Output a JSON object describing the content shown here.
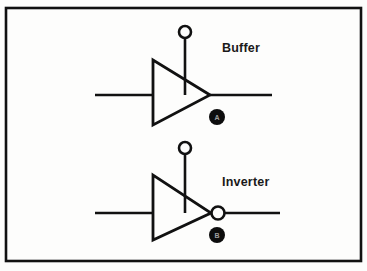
{
  "figure": {
    "background_color": "#fdfdfc",
    "ink_color": "#111111",
    "border": {
      "name": "figure-border",
      "x": 6,
      "y": 8,
      "width": 355,
      "height": 253,
      "stroke_width": 2.6
    }
  },
  "gates": [
    {
      "id": "buffer",
      "label": "Buffer",
      "label_x": 222,
      "label_y": 42,
      "triangle": {
        "back_x": 153,
        "apex_x": 210,
        "top_y": 60,
        "bottom_y": 125,
        "mid_y": 95
      },
      "input_line": {
        "x1": 95,
        "x2": 153,
        "y": 95
      },
      "output_line": {
        "x1": 210,
        "x2": 272,
        "y": 95
      },
      "enable_stem": {
        "x": 185,
        "y1": 38,
        "y2": 95
      },
      "terminal_circle": {
        "cx": 185,
        "cy": 32,
        "r": 6
      },
      "inversion_bubble": null,
      "badge": {
        "cx": 217,
        "cy": 117,
        "r": 8,
        "glyph": "A",
        "fill": "#0d0d0d"
      }
    },
    {
      "id": "inverter",
      "label": "Inverter",
      "label_x": 222,
      "label_y": 176,
      "triangle": {
        "back_x": 153,
        "apex_x": 211,
        "top_y": 175,
        "bottom_y": 240,
        "mid_y": 213
      },
      "input_line": {
        "x1": 95,
        "x2": 153,
        "y": 213
      },
      "output_line": {
        "x1": 225,
        "x2": 280,
        "y": 213
      },
      "enable_stem": {
        "x": 185,
        "y1": 154,
        "y2": 213
      },
      "terminal_circle": {
        "cx": 185,
        "cy": 148,
        "r": 6
      },
      "inversion_bubble": {
        "cx": 218,
        "cy": 213,
        "r": 6.5
      },
      "badge": {
        "cx": 217,
        "cy": 235,
        "r": 8,
        "glyph": "B",
        "fill": "#0d0d0d"
      }
    }
  ]
}
